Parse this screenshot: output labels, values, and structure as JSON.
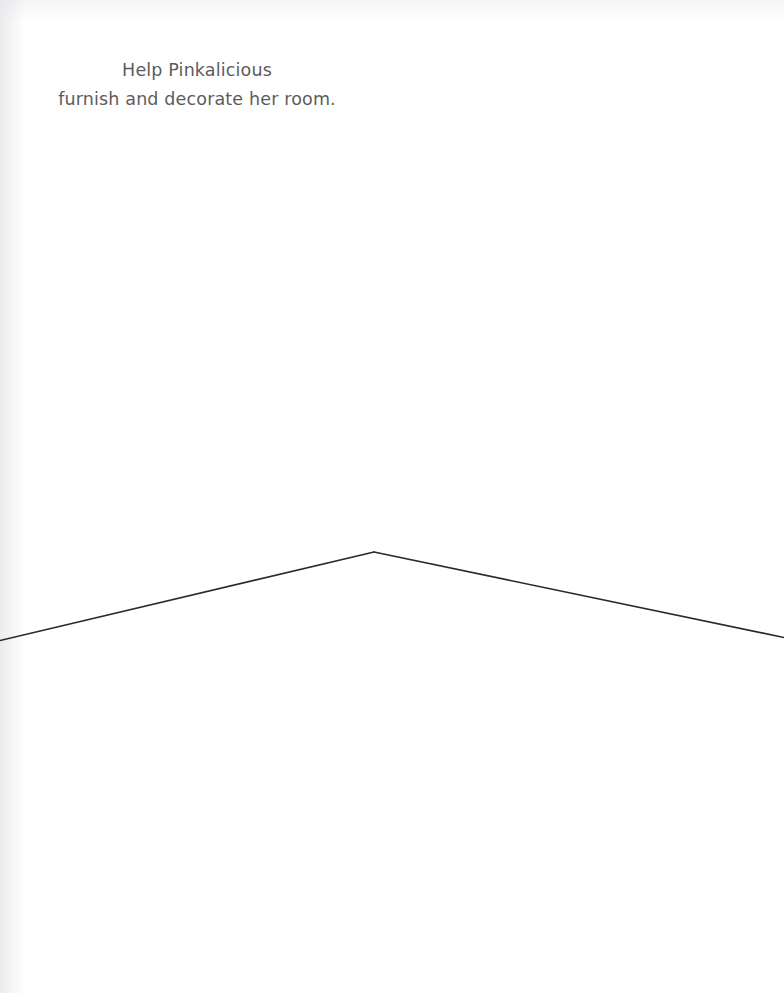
{
  "page": {
    "width": 784,
    "height": 993,
    "background_color": "#ffffff",
    "kind": "activity-book-page"
  },
  "caption": {
    "line_1": "Help Pinkalicious",
    "line_2": "furnish and decorate her room.",
    "full_text": "Help Pinkalicious furnish and decorate her room.",
    "text_color": "#5c5c5c",
    "align": "center"
  },
  "room": {
    "title": "empty room corner",
    "line_color_floor": "#2a2a2a",
    "line_color_wall": "#4d4d4d",
    "line_color_wall_faint": "#8a8a8a",
    "corner_vertex": {
      "x": 374,
      "y": 552
    },
    "wall_corner_line": {
      "x1": 374,
      "y1": 0,
      "x2": 374,
      "y2": 552
    },
    "floor_line_left": {
      "x1": 0,
      "y1": 640,
      "x2": 374,
      "y2": 552
    },
    "floor_line_right": {
      "x1": 374,
      "y1": 552,
      "x2": 784,
      "y2": 637
    },
    "zones": {
      "wall_left_label": "left wall",
      "wall_right_label": "right wall",
      "floor_label": "floor"
    }
  }
}
